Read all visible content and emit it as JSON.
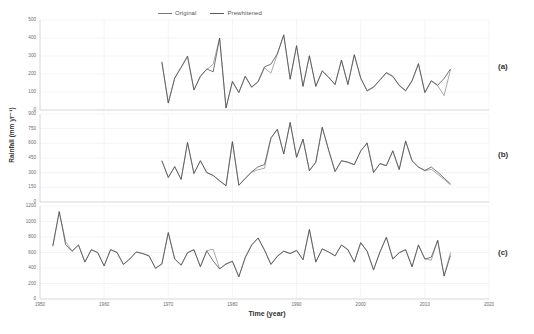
{
  "legend": {
    "entries": [
      {
        "label": "Original",
        "color": "#8d8d8d"
      },
      {
        "label": "Prewhitened",
        "color": "#4a4a4a"
      }
    ]
  },
  "axes": {
    "xlabel": "Time (year)",
    "ylabel": "Rainfall (mm yr⁻¹)"
  },
  "panels": [
    {
      "tag": "(a)"
    },
    {
      "tag": "(b)"
    },
    {
      "tag": "(c)"
    }
  ],
  "chart_data": [
    {
      "type": "line",
      "panel": "(a)",
      "title": "",
      "xlabel": "Time (year)",
      "ylabel": "Rainfall (mm yr⁻¹)",
      "xlim": [
        1950,
        2020
      ],
      "ylim": [
        0,
        500
      ],
      "yticks": [
        0,
        100,
        200,
        300,
        400,
        500
      ],
      "xticks": [
        1950,
        1960,
        1970,
        1980,
        1990,
        2000,
        2010,
        2020
      ],
      "grid": true,
      "legend_position": "top",
      "x": [
        1969,
        1970,
        1971,
        1972,
        1973,
        1974,
        1975,
        1976,
        1977,
        1978,
        1979,
        1980,
        1981,
        1982,
        1983,
        1984,
        1985,
        1986,
        1987,
        1988,
        1989,
        1990,
        1991,
        1992,
        1993,
        1994,
        1995,
        1996,
        1997,
        1998,
        1999,
        2000,
        2001,
        2002,
        2003,
        2004,
        2005,
        2006,
        2007,
        2008,
        2009,
        2010,
        2011,
        2012,
        2013,
        2014
      ],
      "series": [
        {
          "name": "Original",
          "values": [
            265,
            40,
            175,
            235,
            295,
            110,
            185,
            225,
            255,
            400,
            10,
            160,
            95,
            185,
            125,
            155,
            235,
            205,
            310,
            415,
            170,
            355,
            130,
            300,
            130,
            215,
            180,
            140,
            275,
            140,
            305,
            175,
            105,
            125,
            165,
            205,
            185,
            135,
            105,
            160,
            255,
            95,
            160,
            135,
            80,
            225
          ]
        },
        {
          "name": "Prewhitened",
          "values": [
            268,
            38,
            178,
            238,
            300,
            112,
            188,
            228,
            212,
            400,
            12,
            158,
            98,
            188,
            128,
            158,
            240,
            255,
            312,
            418,
            172,
            358,
            132,
            302,
            132,
            218,
            183,
            142,
            278,
            142,
            308,
            178,
            108,
            128,
            168,
            208,
            188,
            138,
            108,
            163,
            258,
            98,
            163,
            138,
            175,
            228
          ]
        }
      ]
    },
    {
      "type": "line",
      "panel": "(b)",
      "title": "",
      "xlabel": "Time (year)",
      "ylabel": "Rainfall (mm yr⁻¹)",
      "xlim": [
        1950,
        2020
      ],
      "ylim": [
        0,
        900
      ],
      "yticks": [
        0,
        150,
        300,
        450,
        600,
        750,
        900
      ],
      "xticks": [
        1950,
        1960,
        1970,
        1980,
        1990,
        2000,
        2010,
        2020
      ],
      "grid": true,
      "legend_position": "top",
      "x": [
        1969,
        1970,
        1971,
        1972,
        1973,
        1974,
        1975,
        1976,
        1977,
        1978,
        1979,
        1980,
        1981,
        1982,
        1983,
        1984,
        1985,
        1986,
        1987,
        1988,
        1989,
        1990,
        1991,
        1992,
        1993,
        1994,
        1995,
        1996,
        1997,
        1998,
        1999,
        2000,
        2001,
        2002,
        2003,
        2004,
        2005,
        2006,
        2007,
        2008,
        2009,
        2010,
        2011,
        2012,
        2013,
        2014
      ],
      "series": [
        {
          "name": "Original",
          "values": [
            420,
            250,
            360,
            230,
            605,
            290,
            420,
            300,
            270,
            215,
            165,
            615,
            170,
            240,
            305,
            330,
            345,
            650,
            740,
            490,
            810,
            455,
            640,
            320,
            405,
            760,
            530,
            310,
            420,
            405,
            380,
            520,
            600,
            300,
            390,
            370,
            520,
            330,
            620,
            420,
            355,
            320,
            335,
            285,
            230,
            175
          ]
        },
        {
          "name": "Prewhitened",
          "values": [
            423,
            252,
            363,
            232,
            610,
            292,
            423,
            302,
            272,
            218,
            168,
            618,
            172,
            243,
            308,
            360,
            383,
            655,
            745,
            492,
            815,
            458,
            643,
            322,
            408,
            765,
            533,
            313,
            423,
            408,
            383,
            523,
            605,
            303,
            393,
            373,
            525,
            333,
            625,
            423,
            358,
            323,
            358,
            305,
            245,
            185
          ]
        }
      ]
    },
    {
      "type": "line",
      "panel": "(c)",
      "title": "",
      "xlabel": "Time (year)",
      "ylabel": "Rainfall (mm yr⁻¹)",
      "xlim": [
        1950,
        2020
      ],
      "ylim": [
        0,
        1200
      ],
      "yticks": [
        0,
        200,
        400,
        600,
        800,
        1000,
        1200
      ],
      "xticks": [
        1950,
        1960,
        1970,
        1980,
        1990,
        2000,
        2010,
        2020
      ],
      "grid": true,
      "legend_position": "top",
      "x": [
        1952,
        1953,
        1954,
        1955,
        1956,
        1957,
        1958,
        1959,
        1960,
        1961,
        1962,
        1963,
        1964,
        1965,
        1966,
        1967,
        1968,
        1969,
        1970,
        1971,
        1972,
        1973,
        1974,
        1975,
        1976,
        1977,
        1978,
        1979,
        1980,
        1981,
        1982,
        1983,
        1984,
        1985,
        1986,
        1987,
        1988,
        1989,
        1990,
        1991,
        1992,
        1993,
        1994,
        1995,
        1996,
        1997,
        1998,
        1999,
        2000,
        2001,
        2002,
        2003,
        2004,
        2005,
        2006,
        2007,
        2008,
        2009,
        2010,
        2011,
        2012,
        2013,
        2014
      ],
      "series": [
        {
          "name": "Original",
          "values": [
            690,
            1130,
            740,
            620,
            700,
            480,
            640,
            600,
            430,
            640,
            605,
            450,
            520,
            610,
            590,
            560,
            400,
            455,
            860,
            520,
            440,
            600,
            640,
            420,
            625,
            640,
            390,
            455,
            490,
            290,
            540,
            700,
            790,
            635,
            450,
            555,
            620,
            590,
            630,
            510,
            900,
            480,
            650,
            610,
            560,
            700,
            640,
            480,
            730,
            620,
            380,
            610,
            800,
            520,
            600,
            640,
            420,
            700,
            520,
            500,
            760,
            300,
            600
          ]
        },
        {
          "name": "Prewhitened",
          "values": [
            680,
            1125,
            700,
            615,
            695,
            475,
            635,
            598,
            425,
            635,
            600,
            445,
            515,
            605,
            585,
            555,
            395,
            450,
            855,
            515,
            435,
            595,
            635,
            415,
            620,
            490,
            388,
            450,
            485,
            285,
            535,
            695,
            785,
            630,
            445,
            550,
            615,
            585,
            625,
            505,
            895,
            475,
            645,
            605,
            555,
            695,
            635,
            475,
            725,
            615,
            375,
            605,
            795,
            515,
            595,
            635,
            415,
            695,
            515,
            540,
            755,
            295,
            560
          ]
        }
      ]
    }
  ]
}
